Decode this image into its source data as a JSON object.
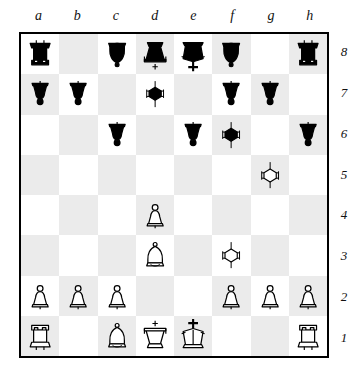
{
  "board": {
    "files": [
      "a",
      "b",
      "c",
      "d",
      "e",
      "f",
      "g",
      "h"
    ],
    "ranks": [
      "8",
      "7",
      "6",
      "5",
      "4",
      "3",
      "2",
      "1"
    ],
    "light_square_color": "#ffffff",
    "dark_square_color": "#ebebeb",
    "border_color": "#000000",
    "orientation": "white-bottom",
    "position_fen": "r1bqkb1r/pp1n1pp1/2p1pn1N/8/3P4/3B1N2/PPP2PPP/R1BQK2R",
    "squares": [
      [
        {
          "square": "a8",
          "piece": "black-rook",
          "glyph": "♜",
          "color": "black",
          "type": "rook"
        },
        {
          "square": "b8",
          "piece": null,
          "glyph": "",
          "color": null,
          "type": null
        },
        {
          "square": "c8",
          "piece": "black-bishop",
          "glyph": "♝",
          "color": "black",
          "type": "bishop"
        },
        {
          "square": "d8",
          "piece": "black-queen",
          "glyph": "♛",
          "color": "black",
          "type": "queen"
        },
        {
          "square": "e8",
          "piece": "black-king",
          "glyph": "♚",
          "color": "black",
          "type": "king"
        },
        {
          "square": "f8",
          "piece": "black-bishop",
          "glyph": "♝",
          "color": "black",
          "type": "bishop"
        },
        {
          "square": "g8",
          "piece": null,
          "glyph": "",
          "color": null,
          "type": null
        },
        {
          "square": "h8",
          "piece": "black-rook",
          "glyph": "♜",
          "color": "black",
          "type": "rook"
        }
      ],
      [
        {
          "square": "a7",
          "piece": "black-pawn",
          "glyph": "♟",
          "color": "black",
          "type": "pawn"
        },
        {
          "square": "b7",
          "piece": "black-pawn",
          "glyph": "♟",
          "color": "black",
          "type": "pawn"
        },
        {
          "square": "c7",
          "piece": null,
          "glyph": "",
          "color": null,
          "type": null
        },
        {
          "square": "d7",
          "piece": "black-knight",
          "glyph": "♞",
          "color": "black",
          "type": "knight"
        },
        {
          "square": "e7",
          "piece": null,
          "glyph": "",
          "color": null,
          "type": null
        },
        {
          "square": "f7",
          "piece": "black-pawn",
          "glyph": "♟",
          "color": "black",
          "type": "pawn"
        },
        {
          "square": "g7",
          "piece": "black-pawn",
          "glyph": "♟",
          "color": "black",
          "type": "pawn"
        },
        {
          "square": "h7",
          "piece": null,
          "glyph": "",
          "color": null,
          "type": null
        }
      ],
      [
        {
          "square": "a6",
          "piece": null,
          "glyph": "",
          "color": null,
          "type": null
        },
        {
          "square": "b6",
          "piece": null,
          "glyph": "",
          "color": null,
          "type": null
        },
        {
          "square": "c6",
          "piece": "black-pawn",
          "glyph": "♟",
          "color": "black",
          "type": "pawn"
        },
        {
          "square": "d6",
          "piece": null,
          "glyph": "",
          "color": null,
          "type": null
        },
        {
          "square": "e6",
          "piece": "black-pawn",
          "glyph": "♟",
          "color": "black",
          "type": "pawn"
        },
        {
          "square": "f6",
          "piece": "black-knight",
          "glyph": "♞",
          "color": "black",
          "type": "knight"
        },
        {
          "square": "g6",
          "piece": null,
          "glyph": "",
          "color": null,
          "type": null
        },
        {
          "square": "h6",
          "piece": "black-pawn",
          "glyph": "♟",
          "color": "black",
          "type": "pawn"
        }
      ],
      [
        {
          "square": "a5",
          "piece": null,
          "glyph": "",
          "color": null,
          "type": null
        },
        {
          "square": "b5",
          "piece": null,
          "glyph": "",
          "color": null,
          "type": null
        },
        {
          "square": "c5",
          "piece": null,
          "glyph": "",
          "color": null,
          "type": null
        },
        {
          "square": "d5",
          "piece": null,
          "glyph": "",
          "color": null,
          "type": null
        },
        {
          "square": "e5",
          "piece": null,
          "glyph": "",
          "color": null,
          "type": null
        },
        {
          "square": "f5",
          "piece": null,
          "glyph": "",
          "color": null,
          "type": null
        },
        {
          "square": "g5",
          "piece": "white-knight",
          "glyph": "♘",
          "color": "white",
          "type": "knight"
        },
        {
          "square": "h5",
          "piece": null,
          "glyph": "",
          "color": null,
          "type": null
        }
      ],
      [
        {
          "square": "a4",
          "piece": null,
          "glyph": "",
          "color": null,
          "type": null
        },
        {
          "square": "b4",
          "piece": null,
          "glyph": "",
          "color": null,
          "type": null
        },
        {
          "square": "c4",
          "piece": null,
          "glyph": "",
          "color": null,
          "type": null
        },
        {
          "square": "d4",
          "piece": "white-pawn",
          "glyph": "♙",
          "color": "white",
          "type": "pawn"
        },
        {
          "square": "e4",
          "piece": null,
          "glyph": "",
          "color": null,
          "type": null
        },
        {
          "square": "f4",
          "piece": null,
          "glyph": "",
          "color": null,
          "type": null
        },
        {
          "square": "g4",
          "piece": null,
          "glyph": "",
          "color": null,
          "type": null
        },
        {
          "square": "h4",
          "piece": null,
          "glyph": "",
          "color": null,
          "type": null
        }
      ],
      [
        {
          "square": "a3",
          "piece": null,
          "glyph": "",
          "color": null,
          "type": null
        },
        {
          "square": "b3",
          "piece": null,
          "glyph": "",
          "color": null,
          "type": null
        },
        {
          "square": "c3",
          "piece": null,
          "glyph": "",
          "color": null,
          "type": null
        },
        {
          "square": "d3",
          "piece": "white-bishop",
          "glyph": "♗",
          "color": "white",
          "type": "bishop"
        },
        {
          "square": "e3",
          "piece": null,
          "glyph": "",
          "color": null,
          "type": null
        },
        {
          "square": "f3",
          "piece": "white-knight",
          "glyph": "♘",
          "color": "white",
          "type": "knight"
        },
        {
          "square": "g3",
          "piece": null,
          "glyph": "",
          "color": null,
          "type": null
        },
        {
          "square": "h3",
          "piece": null,
          "glyph": "",
          "color": null,
          "type": null
        }
      ],
      [
        {
          "square": "a2",
          "piece": "white-pawn",
          "glyph": "♙",
          "color": "white",
          "type": "pawn"
        },
        {
          "square": "b2",
          "piece": "white-pawn",
          "glyph": "♙",
          "color": "white",
          "type": "pawn"
        },
        {
          "square": "c2",
          "piece": "white-pawn",
          "glyph": "♙",
          "color": "white",
          "type": "pawn"
        },
        {
          "square": "d2",
          "piece": null,
          "glyph": "",
          "color": null,
          "type": null
        },
        {
          "square": "e2",
          "piece": null,
          "glyph": "",
          "color": null,
          "type": null
        },
        {
          "square": "f2",
          "piece": "white-pawn",
          "glyph": "♙",
          "color": "white",
          "type": "pawn"
        },
        {
          "square": "g2",
          "piece": "white-pawn",
          "glyph": "♙",
          "color": "white",
          "type": "pawn"
        },
        {
          "square": "h2",
          "piece": "white-pawn",
          "glyph": "♙",
          "color": "white",
          "type": "pawn"
        }
      ],
      [
        {
          "square": "a1",
          "piece": "white-rook",
          "glyph": "♖",
          "color": "white",
          "type": "rook"
        },
        {
          "square": "b1",
          "piece": null,
          "glyph": "",
          "color": null,
          "type": null
        },
        {
          "square": "c1",
          "piece": "white-bishop",
          "glyph": "♗",
          "color": "white",
          "type": "bishop"
        },
        {
          "square": "d1",
          "piece": "white-queen",
          "glyph": "♕",
          "color": "white",
          "type": "queen"
        },
        {
          "square": "e1",
          "piece": "white-king",
          "glyph": "♔",
          "color": "white",
          "type": "king"
        },
        {
          "square": "f1",
          "piece": null,
          "glyph": "",
          "color": null,
          "type": null
        },
        {
          "square": "g1",
          "piece": null,
          "glyph": "",
          "color": null,
          "type": null
        },
        {
          "square": "h1",
          "piece": "white-rook",
          "glyph": "♖",
          "color": "white",
          "type": "rook"
        }
      ]
    ]
  }
}
